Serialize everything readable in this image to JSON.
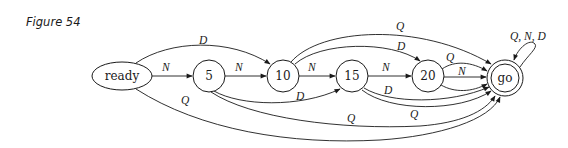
{
  "figure": {
    "label": "Figure 54"
  },
  "diagram": {
    "type": "finite-state-machine",
    "nodes": [
      {
        "id": "ready",
        "label": "ready",
        "shape": "ellipse",
        "accepting": false
      },
      {
        "id": "5",
        "label": "5",
        "shape": "circle",
        "accepting": false
      },
      {
        "id": "10",
        "label": "10",
        "shape": "circle",
        "accepting": false
      },
      {
        "id": "15",
        "label": "15",
        "shape": "circle",
        "accepting": false
      },
      {
        "id": "20",
        "label": "20",
        "shape": "circle",
        "accepting": false
      },
      {
        "id": "go",
        "label": "go",
        "shape": "double-circle",
        "accepting": true
      }
    ],
    "edges": [
      {
        "from": "ready",
        "to": "5",
        "label": "N"
      },
      {
        "from": "ready",
        "to": "10",
        "label": "D"
      },
      {
        "from": "ready",
        "to": "go",
        "label": "Q"
      },
      {
        "from": "5",
        "to": "10",
        "label": "N"
      },
      {
        "from": "5",
        "to": "15",
        "label": "D"
      },
      {
        "from": "5",
        "to": "go",
        "label": "Q"
      },
      {
        "from": "10",
        "to": "15",
        "label": "N"
      },
      {
        "from": "10",
        "to": "20",
        "label": "D"
      },
      {
        "from": "10",
        "to": "go",
        "label": "Q"
      },
      {
        "from": "15",
        "to": "20",
        "label": "N"
      },
      {
        "from": "15",
        "to": "go",
        "label": "D"
      },
      {
        "from": "15",
        "to": "go",
        "label": "Q"
      },
      {
        "from": "20",
        "to": "go",
        "label": "Q"
      },
      {
        "from": "20",
        "to": "go",
        "label": "N"
      },
      {
        "from": "20",
        "to": "go",
        "label": "D"
      },
      {
        "from": "go",
        "to": "go",
        "label": "Q, N, D"
      }
    ]
  }
}
